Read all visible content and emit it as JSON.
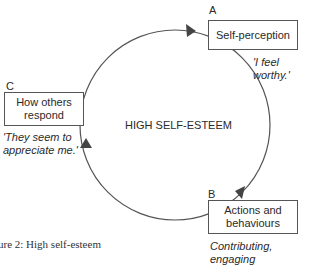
{
  "diagram": {
    "center_label": "HIGH SELF-ESTEEM",
    "nodes": [
      {
        "id": "A",
        "letter": "A",
        "label": "Self-perception",
        "quote": "'I feel worthy.'"
      },
      {
        "id": "B",
        "letter": "B",
        "label_line1": "Actions and",
        "label_line2": "behaviours",
        "quote": "Contributing, engaging"
      },
      {
        "id": "C",
        "letter": "C",
        "label_line1": "How others",
        "label_line2": "respond",
        "quote_line1": "'They seem to",
        "quote_line2": "appreciate me.'"
      }
    ],
    "edges": [
      {
        "from": "A",
        "to": "B"
      },
      {
        "from": "B",
        "to": "C"
      },
      {
        "from": "C",
        "to": "A"
      }
    ],
    "caption": "ure 2: High self-esteem",
    "colors": {
      "line": "#555555",
      "arrow": "#444444",
      "text": "#2a2a2a"
    }
  }
}
